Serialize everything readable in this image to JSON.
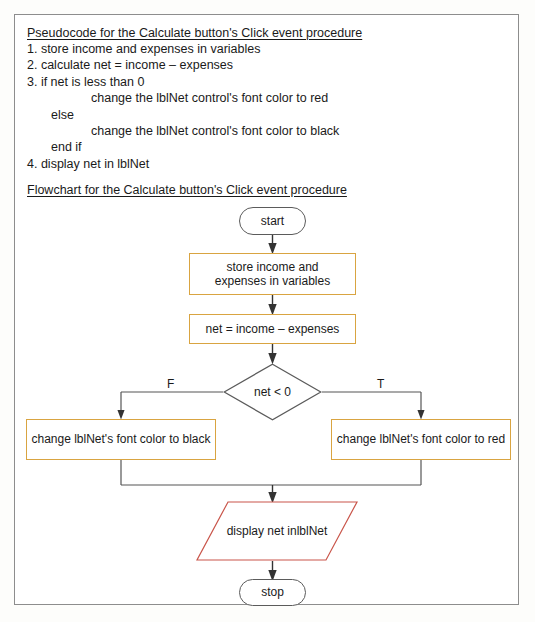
{
  "figure": {
    "colors": {
      "process_border": "#d9a441",
      "terminator_border": "#5b5b5b",
      "io_border": "#c9554a",
      "connector": "#444444",
      "frame_border": "#8d8d8d",
      "text": "#1a1a1a"
    }
  },
  "pseudocode": {
    "heading": "Pseudocode for the Calculate button's Click event procedure",
    "lines": [
      {
        "text": "1. store income and expenses in variables",
        "indent": 0
      },
      {
        "text": "2. calculate net = income – expenses",
        "indent": 0
      },
      {
        "text": "3. if net is less than 0",
        "indent": 0
      },
      {
        "text": "change the lblNet control's font color to red",
        "indent": 2
      },
      {
        "text": "else",
        "indent": 1
      },
      {
        "text": "change the lblNet control's font color to black",
        "indent": 2
      },
      {
        "text": "end if",
        "indent": 1
      },
      {
        "text": "4. display net in lblNet",
        "indent": 0
      }
    ]
  },
  "flowchart": {
    "heading": "Flowchart for the Calculate button's Click event procedure",
    "nodes": {
      "start": {
        "label": "start",
        "shape": "terminator"
      },
      "store": {
        "label": "store income and\nexpenses in variables",
        "line1": "store income and",
        "line2": "expenses in variables",
        "shape": "process"
      },
      "calc": {
        "label": "net = income – expenses",
        "shape": "process"
      },
      "decision": {
        "label": "net < 0",
        "shape": "decision"
      },
      "false_branch": {
        "label": "change lblNet's font color to black",
        "shape": "process"
      },
      "true_branch": {
        "label": "change lblNet's font color to red",
        "shape": "process"
      },
      "display": {
        "line1": "display net in",
        "line2": "lblNet",
        "shape": "parallelogram"
      },
      "stop": {
        "label": "stop",
        "shape": "terminator"
      }
    },
    "branch_labels": {
      "false": "F",
      "true": "T"
    }
  }
}
